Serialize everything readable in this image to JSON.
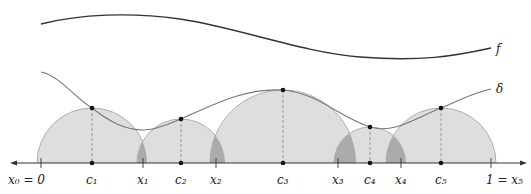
{
  "diagram": {
    "curves": {
      "f": {
        "label": "f",
        "color": "#333333"
      },
      "delta": {
        "label": "δ",
        "color": "#777777"
      }
    },
    "axis": {
      "partition_points": [
        {
          "name": "x",
          "sub": "0",
          "suffix": " = 0",
          "x": 41
        },
        {
          "name": "x",
          "sub": "1",
          "x": 143
        },
        {
          "name": "x",
          "sub": "2",
          "x": 216
        },
        {
          "name": "x",
          "sub": "3",
          "x": 338
        },
        {
          "name": "x",
          "sub": "4",
          "x": 401
        },
        {
          "name": "x",
          "sub": "5",
          "prefix": "1 = ",
          "x": 491
        }
      ],
      "tags": [
        {
          "name": "c",
          "sub": "1",
          "x": 92,
          "delta_y": 108
        },
        {
          "name": "c",
          "sub": "2",
          "x": 181,
          "delta_y": 119
        },
        {
          "name": "c",
          "sub": "3",
          "x": 283,
          "delta_y": 90
        },
        {
          "name": "c",
          "sub": "4",
          "x": 370,
          "delta_y": 127
        },
        {
          "name": "c",
          "sub": "5",
          "x": 441,
          "delta_y": 108
        }
      ]
    },
    "labels": {
      "x0": "x₀ = 0",
      "x1": "x₁",
      "x2": "x₂",
      "x3": "x₃",
      "x4": "x₄",
      "x5": "1 = x₅",
      "c1": "c₁",
      "c2": "c₂",
      "c3": "c₃",
      "c4": "c₄",
      "c5": "c₅",
      "f": "f",
      "delta": "δ"
    },
    "colors": {
      "disk_fill": "#dcdcdc",
      "overlap_fill": "#a9a9a9",
      "disk_stroke": "#999999",
      "axis": "#333333"
    }
  }
}
